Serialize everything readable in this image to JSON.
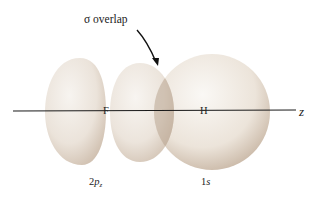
{
  "diagram": {
    "title_annotation": "σ overlap",
    "annotation_parts": {
      "symbol": "σ",
      "text": " overlap"
    },
    "axis_label": "z",
    "atoms": [
      {
        "symbol": "F",
        "orbital_label_prefix": "2",
        "orbital_label_letter": "p",
        "orbital_label_sub": "z"
      },
      {
        "symbol": "H",
        "orbital_label_prefix": "1",
        "orbital_label_letter": "s"
      }
    ],
    "colors": {
      "lobe_fill": "#ece6df",
      "lobe_shadow": "#c9b8a6",
      "overlap_fill": "#c4b3a3",
      "axis_line": "#1a1a1a",
      "text": "#222222"
    }
  }
}
